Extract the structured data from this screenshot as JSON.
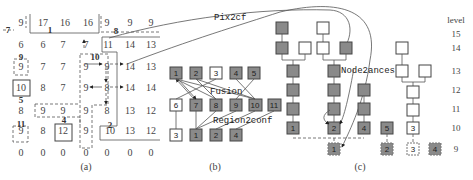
{
  "panel_a": {
    "caption": "(a)",
    "grid": [
      [
        "9",
        "17",
        "16",
        "16",
        "9",
        "9",
        "9"
      ],
      [
        "6",
        "6",
        "7",
        "7",
        "11",
        "14",
        "13"
      ],
      [
        "9",
        "7",
        "7",
        "9",
        "9",
        "14",
        "13"
      ],
      [
        "10",
        "8",
        "7",
        "9",
        "8",
        "14",
        "14"
      ],
      [
        "8",
        "9",
        "9",
        "9",
        "8",
        "13",
        "12"
      ],
      [
        "9",
        "8",
        "12",
        "9",
        "10",
        "13",
        "12"
      ],
      [
        "0",
        "0",
        "0",
        "0",
        "0",
        "0",
        "0"
      ]
    ],
    "region_labels": [
      "1",
      "2",
      "4",
      "5",
      "7",
      "8",
      "9",
      "10",
      "11"
    ]
  },
  "panel_b": {
    "caption": "(b)",
    "top_row": [
      "1",
      "2",
      "3",
      "4",
      "5"
    ],
    "mid_row": [
      "6",
      "7",
      "8",
      "9",
      "10",
      "11"
    ],
    "bottom_row": [
      "3",
      "1",
      "2",
      "4"
    ],
    "fusion_label": "Fusion",
    "region2conf_label": "Region2conf"
  },
  "panel_c": {
    "caption": "(c)",
    "node2ances_label": "Node2ances",
    "leaf_labels_level10": [
      "1",
      "2",
      "4",
      "5",
      "3"
    ],
    "leaf_labels_level9": [
      "1",
      "2",
      "3",
      "4"
    ],
    "level_header": "level",
    "levels": [
      "15",
      "14",
      "13",
      "12",
      "11",
      "10",
      "9"
    ]
  },
  "arrows": {
    "pix2cf_label": "Pix2cf"
  },
  "colors": {
    "filled_node": "#8a8a8a",
    "empty_node": "#ffffff",
    "line": "#555555"
  }
}
